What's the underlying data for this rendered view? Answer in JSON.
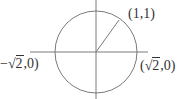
{
  "diagram": {
    "type": "coordinate-circle",
    "stroke_color": "#7a7a7a",
    "text_color": "#333333",
    "center": {
      "x": 96,
      "y": 52
    },
    "radius": 41,
    "x_axis": {
      "x1": 30,
      "x2": 148,
      "y": 52
    },
    "y_axis": {
      "x": 96,
      "y1": 0,
      "y2": 99
    },
    "radius_line": {
      "x1": 96,
      "y1": 52,
      "x2": 119,
      "y2": 20
    },
    "labels": {
      "point_1_1": "(1,1)",
      "neg_sqrt2": {
        "prefix": "−",
        "root": "2",
        "suffix": ",0)"
      },
      "pos_sqrt2": {
        "prefix": "(",
        "root": "2",
        "suffix": ",0)"
      }
    }
  }
}
